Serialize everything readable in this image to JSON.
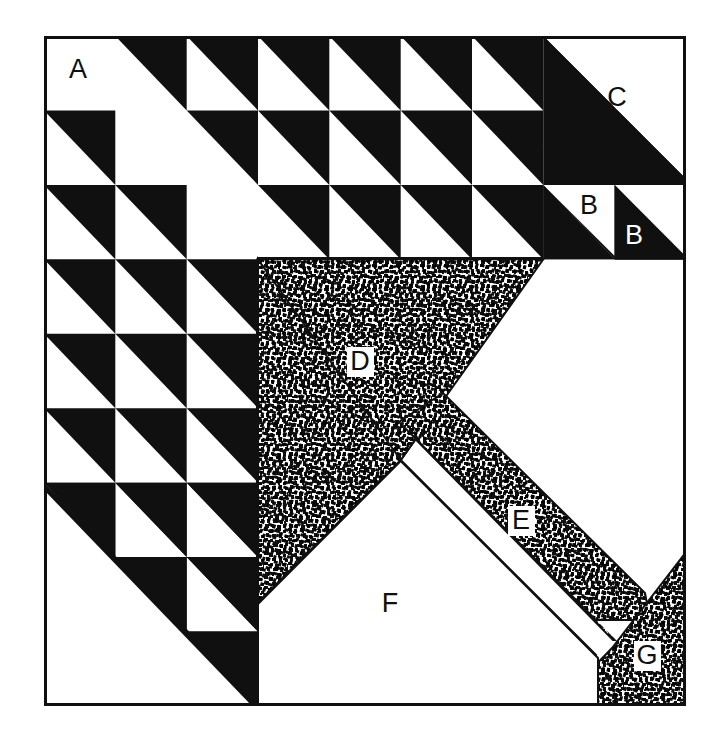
{
  "figure": {
    "kind": "line-art-diagram",
    "colors": {
      "ink": "#101010",
      "paper": "#ffffff",
      "stipple": "#101010"
    },
    "frame": {
      "x": 44,
      "y": 36,
      "width": 642,
      "height": 670,
      "stroke_width": 3
    },
    "grid": {
      "columns": 9,
      "rows": 9,
      "cell_width": 71.33,
      "cell_height": 74.44
    }
  },
  "labels": [
    {
      "id": "A",
      "text": "A",
      "x": 78,
      "y": 70,
      "style": "dark",
      "region": "white-square-top-left"
    },
    {
      "id": "B1",
      "text": "B",
      "x": 590,
      "y": 206,
      "style": "dark",
      "region": "white-triangle-small"
    },
    {
      "id": "B2",
      "text": "B",
      "x": 634,
      "y": 236,
      "style": "light",
      "region": "black-triangle-small"
    },
    {
      "id": "C",
      "text": "C",
      "x": 617,
      "y": 98,
      "style": "dark",
      "region": "white-corner-upper-right"
    },
    {
      "id": "D",
      "text": "D",
      "x": 360,
      "y": 362,
      "style": "boxed",
      "region": "stippled-large-triangle"
    },
    {
      "id": "E",
      "text": "E",
      "x": 521,
      "y": 521,
      "style": "boxed",
      "region": "stippled-diagonal-band"
    },
    {
      "id": "F",
      "text": "F",
      "x": 390,
      "y": 604,
      "style": "dark",
      "region": "white-pentagon"
    },
    {
      "id": "G",
      "text": "G",
      "x": 647,
      "y": 656,
      "style": "boxed",
      "region": "stippled-corner-triangle"
    }
  ],
  "regions": [
    {
      "id": "A",
      "name": "plain white square",
      "fill": "white"
    },
    {
      "id": "B",
      "name": "half-square triangles",
      "fill": "black-and-white"
    },
    {
      "id": "C",
      "name": "plain white corner",
      "fill": "white"
    },
    {
      "id": "D",
      "name": "large stippled triangle",
      "fill": "stipple"
    },
    {
      "id": "E",
      "name": "stippled diagonal band",
      "fill": "stipple"
    },
    {
      "id": "F",
      "name": "plain white pentagon",
      "fill": "white"
    },
    {
      "id": "G",
      "name": "small stippled triangle",
      "fill": "stipple"
    }
  ],
  "triangle_grid": {
    "description": "half-square triangle units, black half on the lower-left of each unit",
    "rows": [
      {
        "row": 1,
        "cells": [
          "blank",
          "tri",
          "tri",
          "tri",
          "tri",
          "tri",
          "tri",
          "tri",
          "none"
        ]
      },
      {
        "row": 2,
        "cells": [
          "tri",
          "blank",
          "tri",
          "tri",
          "tri",
          "tri",
          "tri",
          "tri",
          "none"
        ]
      },
      {
        "row": 3,
        "cells": [
          "tri",
          "tri",
          "blank",
          "tri",
          "tri",
          "tri",
          "tri",
          "tri",
          "tri"
        ]
      },
      {
        "row": 4,
        "cells": [
          "tri",
          "tri",
          "tri",
          "none",
          "none",
          "none",
          "none",
          "none",
          "none"
        ]
      },
      {
        "row": 5,
        "cells": [
          "tri",
          "tri",
          "tri",
          "none",
          "none",
          "none",
          "none",
          "none",
          "none"
        ]
      },
      {
        "row": 6,
        "cells": [
          "tri",
          "tri",
          "tri",
          "none",
          "none",
          "none",
          "none",
          "none",
          "none"
        ]
      },
      {
        "row": 7,
        "cells": [
          "tri",
          "tri",
          "tri",
          "none",
          "none",
          "none",
          "none",
          "none",
          "none"
        ]
      },
      {
        "row": 8,
        "cells": [
          "none",
          "tri",
          "tri",
          "none",
          "none",
          "none",
          "none",
          "none",
          "none"
        ]
      },
      {
        "row": 9,
        "cells": [
          "none",
          "none",
          "tri",
          "none",
          "none",
          "none",
          "none",
          "none",
          "none"
        ]
      }
    ]
  }
}
